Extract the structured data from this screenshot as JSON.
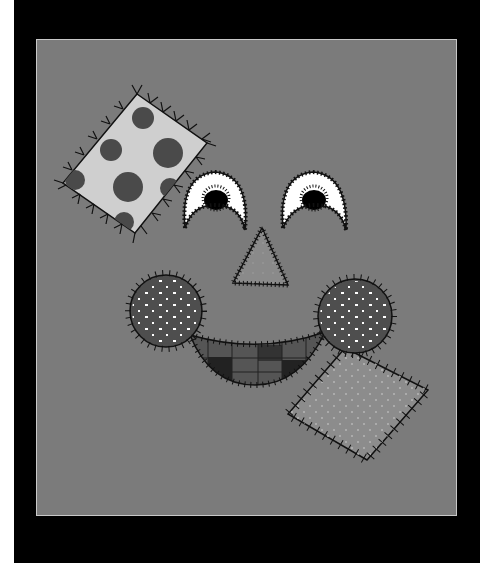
{
  "image": {
    "description": "Grayscale quilt appliqué face with patches stitched on a gray background",
    "colors": {
      "background_outer": "#000000",
      "left_strip": "#ffffff",
      "panel": "#7b7b7b",
      "panel_border": "#c8c8c8",
      "stitch": "#111111",
      "polka_patch": "#cfcfcf",
      "polka_dot": "#4a4a4a",
      "eye_white": "#ffffff",
      "pupil": "#000000",
      "nose": "#8a8a8a",
      "cheek": "#4e4e4e",
      "mouth_light": "#555555",
      "mouth_dark": "#222222",
      "bottom_patch": "#8c8c8c"
    },
    "elements": [
      {
        "name": "polka-dot-patch",
        "shape": "rotated square"
      },
      {
        "name": "left-eye",
        "shape": "arch with pupil"
      },
      {
        "name": "right-eye",
        "shape": "arch with pupil"
      },
      {
        "name": "nose",
        "shape": "triangle"
      },
      {
        "name": "left-cheek",
        "shape": "circle with white dots"
      },
      {
        "name": "right-cheek",
        "shape": "circle with white dots"
      },
      {
        "name": "mouth",
        "shape": "checkered crescent"
      },
      {
        "name": "dotted-patch",
        "shape": "rotated square"
      }
    ]
  }
}
